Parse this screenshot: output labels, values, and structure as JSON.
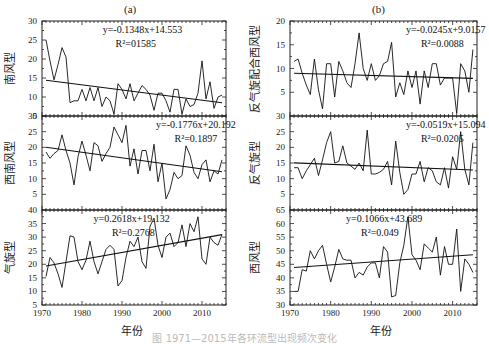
{
  "figure": {
    "caption": "图  1971—2015年各环流型出现频次变化",
    "xlabel": "年份",
    "columns": [
      {
        "label": "(a)"
      },
      {
        "label": "(b)"
      }
    ]
  },
  "chart_data": [
    {
      "type": "line",
      "panel": "a-1",
      "column": "(a)",
      "ylabel": "南风型",
      "ylim": [
        5,
        30
      ],
      "yticks": [
        5,
        10,
        15,
        20,
        25,
        30
      ],
      "xlim": [
        1970,
        2016
      ],
      "xticks": [
        1970,
        1980,
        1990,
        2000,
        2010
      ],
      "equation": "y=-0.1348x+14.553",
      "r2": "R²=01585",
      "trend": {
        "slope": -0.1348,
        "intercept": 14.553
      },
      "x": [
        1971,
        1972,
        1973,
        1974,
        1975,
        1976,
        1977,
        1978,
        1979,
        1980,
        1981,
        1982,
        1983,
        1984,
        1985,
        1986,
        1987,
        1988,
        1989,
        1990,
        1991,
        1992,
        1993,
        1994,
        1995,
        1996,
        1997,
        1998,
        1999,
        2000,
        2001,
        2002,
        2003,
        2004,
        2005,
        2006,
        2007,
        2008,
        2009,
        2010,
        2011,
        2012,
        2013,
        2014,
        2015
      ],
      "values": [
        25,
        19.5,
        14.5,
        18.5,
        23,
        20.5,
        8.5,
        9,
        9,
        12,
        9,
        12.5,
        9,
        12.5,
        7.5,
        10,
        9,
        5.5,
        13.5,
        12,
        9.5,
        13.5,
        9,
        11,
        13,
        12,
        10.5,
        6.5,
        11,
        11,
        9,
        6,
        12,
        12,
        5.5,
        9.5,
        7.5,
        8,
        11,
        19.5,
        9.5,
        14,
        7,
        10,
        10.5
      ]
    },
    {
      "type": "line",
      "panel": "a-2",
      "column": "(a)",
      "ylabel": "西南风型",
      "ylim": [
        0,
        30
      ],
      "yticks": [
        5,
        10,
        15,
        20,
        25,
        30
      ],
      "xlim": [
        1970,
        2016
      ],
      "xticks": [
        1970,
        1980,
        1990,
        2000,
        2010
      ],
      "equation": "y=-0.1776x+20.192",
      "r2": "R²=0.1897",
      "trend": {
        "slope": -0.1776,
        "intercept": 20.192
      },
      "x": [
        1971,
        1972,
        1973,
        1974,
        1975,
        1976,
        1977,
        1978,
        1979,
        1980,
        1981,
        1982,
        1983,
        1984,
        1985,
        1986,
        1987,
        1988,
        1989,
        1990,
        1991,
        1992,
        1993,
        1994,
        1995,
        1996,
        1997,
        1998,
        1999,
        2000,
        2001,
        2002,
        2003,
        2004,
        2005,
        2006,
        2007,
        2008,
        2009,
        2010,
        2011,
        2012,
        2013,
        2014,
        2015
      ],
      "values": [
        18.5,
        16.5,
        18,
        19,
        24,
        19,
        15,
        8,
        17,
        22,
        17.5,
        12.5,
        21.5,
        20.5,
        15.5,
        18,
        20,
        26.5,
        24,
        21.5,
        27,
        14,
        19.5,
        11.5,
        19,
        19,
        12.5,
        21,
        9,
        15,
        3.5,
        6.5,
        12,
        10,
        11,
        20.5,
        17.5,
        12,
        10,
        14.5,
        16,
        9,
        12.5,
        11.5,
        16
      ]
    },
    {
      "type": "line",
      "panel": "a-3",
      "column": "(a)",
      "ylabel": "气旋型",
      "ylim": [
        5,
        40
      ],
      "yticks": [
        5,
        10,
        15,
        20,
        25,
        30,
        35,
        40
      ],
      "xlim": [
        1970,
        2016
      ],
      "xticks": [
        1970,
        1980,
        1990,
        2000,
        2010
      ],
      "equation": "y=0.2618x+19.132",
      "r2": "R²=0.2768",
      "trend": {
        "slope": 0.2618,
        "intercept": 19.132
      },
      "x": [
        1971,
        1972,
        1973,
        1974,
        1975,
        1976,
        1977,
        1978,
        1979,
        1980,
        1981,
        1982,
        1983,
        1984,
        1985,
        1986,
        1987,
        1988,
        1989,
        1990,
        1991,
        1992,
        1993,
        1994,
        1995,
        1996,
        1997,
        1998,
        1999,
        2000,
        2001,
        2002,
        2003,
        2004,
        2005,
        2006,
        2007,
        2008,
        2009,
        2010,
        2011,
        2012,
        2013,
        2014,
        2015
      ],
      "values": [
        15.5,
        22.5,
        20.5,
        16.5,
        11.5,
        21,
        30.5,
        30,
        21,
        18,
        21.5,
        28.5,
        21,
        16.5,
        21,
        25.5,
        27,
        25.5,
        12,
        14,
        22.5,
        28.5,
        26.5,
        30,
        21,
        18.5,
        34,
        37,
        27,
        22.5,
        30,
        31.5,
        26.5,
        28,
        34.5,
        26.5,
        35,
        32,
        37.5,
        22,
        20,
        30,
        28,
        27,
        31
      ]
    },
    {
      "type": "line",
      "panel": "b-1",
      "column": "(b)",
      "ylabel": "反气旋配合西风型",
      "ylim": [
        0,
        20
      ],
      "yticks": [
        5,
        10,
        15,
        20
      ],
      "xlim": [
        1970,
        2016
      ],
      "xticks": [
        1970,
        1980,
        1990,
        2000,
        2010
      ],
      "equation": "y=-0.0245x+9.0157",
      "r2": "R²=0.0088",
      "trend": {
        "slope": -0.0245,
        "intercept": 9.0157
      },
      "x": [
        1971,
        1972,
        1973,
        1974,
        1975,
        1976,
        1977,
        1978,
        1979,
        1980,
        1981,
        1982,
        1983,
        1984,
        1985,
        1986,
        1987,
        1988,
        1989,
        1990,
        1991,
        1992,
        1993,
        1994,
        1995,
        1996,
        1997,
        1998,
        1999,
        2000,
        2001,
        2002,
        2003,
        2004,
        2005,
        2006,
        2007,
        2008,
        2009,
        2010,
        2011,
        2012,
        2013,
        2014,
        2015
      ],
      "values": [
        11.5,
        12,
        9,
        6.5,
        4.5,
        12,
        5.5,
        1.5,
        11,
        11,
        4,
        11.5,
        9.5,
        7,
        6,
        11,
        17.5,
        10,
        7.5,
        11,
        7.5,
        8.5,
        11,
        11.5,
        15.5,
        4,
        7,
        4.5,
        9.5,
        6,
        9.5,
        2.5,
        9.5,
        6,
        11,
        11,
        6.5,
        8,
        8,
        8,
        0.5,
        11,
        9.5,
        5,
        14
      ]
    },
    {
      "type": "line",
      "panel": "b-2",
      "column": "(b)",
      "ylabel": "反气旋型",
      "ylim": [
        0,
        30
      ],
      "yticks": [
        5,
        10,
        15,
        20,
        25,
        30
      ],
      "xlim": [
        1970,
        2016
      ],
      "xticks": [
        1970,
        1980,
        1990,
        2000,
        2010
      ],
      "equation": "y=-0.0519x+15.094",
      "r2": "R²=0.0205",
      "trend": {
        "slope": -0.0519,
        "intercept": 15.094
      },
      "x": [
        1971,
        1972,
        1973,
        1974,
        1975,
        1976,
        1977,
        1978,
        1979,
        1980,
        1981,
        1982,
        1983,
        1984,
        1985,
        1986,
        1987,
        1988,
        1989,
        1990,
        1991,
        1992,
        1993,
        1994,
        1995,
        1996,
        1997,
        1998,
        1999,
        2000,
        2001,
        2002,
        2003,
        2004,
        2005,
        2006,
        2007,
        2008,
        2009,
        2010,
        2011,
        2012,
        2013,
        2014,
        2015
      ],
      "values": [
        13.5,
        13.5,
        10,
        12.5,
        14.5,
        16.5,
        11,
        16,
        21.5,
        25,
        15,
        15.5,
        20.5,
        15,
        14,
        13,
        15,
        12.5,
        25.5,
        11.5,
        11.5,
        12,
        13,
        15.5,
        8,
        22,
        12,
        5,
        6.5,
        11.5,
        11.5,
        15.5,
        9,
        13.5,
        12.5,
        9,
        8,
        13.5,
        7,
        17,
        13,
        25,
        13,
        8,
        21.5
      ]
    },
    {
      "type": "line",
      "panel": "b-3",
      "column": "(b)",
      "ylabel": "西风型",
      "ylim": [
        30,
        65
      ],
      "yticks": [
        30,
        35,
        40,
        45,
        50,
        55,
        60,
        65
      ],
      "xlim": [
        1970,
        2016
      ],
      "xticks": [
        1970,
        1980,
        1990,
        2000,
        2010
      ],
      "equation": "y=0.1066x+43.689",
      "r2": "R²=0.049",
      "trend": {
        "slope": 0.1066,
        "intercept": 43.689
      },
      "x": [
        1971,
        1972,
        1973,
        1974,
        1975,
        1976,
        1977,
        1978,
        1979,
        1980,
        1981,
        1982,
        1983,
        1984,
        1985,
        1986,
        1987,
        1988,
        1989,
        1990,
        1991,
        1992,
        1993,
        1994,
        1995,
        1996,
        1997,
        1998,
        1999,
        2000,
        2001,
        2002,
        2003,
        2004,
        2005,
        2006,
        2007,
        2008,
        2009,
        2010,
        2011,
        2012,
        2013,
        2014,
        2015
      ],
      "values": [
        35,
        35,
        43,
        42.5,
        50,
        47,
        50,
        52,
        45,
        38.5,
        44,
        50.5,
        47,
        46.5,
        46.5,
        40,
        42,
        41,
        44,
        45.5,
        45.5,
        40,
        51.5,
        49.5,
        33,
        33.5,
        45.5,
        52,
        62.5,
        48.5,
        46.5,
        43,
        52.5,
        51,
        49.5,
        55,
        41,
        51.5,
        45,
        45,
        58,
        35,
        47,
        45,
        42,
        59
      ]
    }
  ]
}
